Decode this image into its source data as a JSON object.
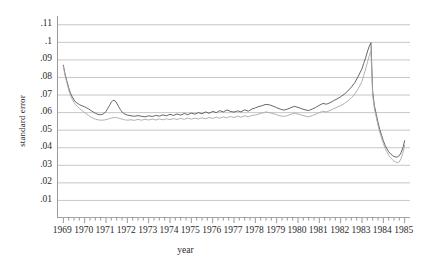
{
  "chart_data": {
    "type": "line",
    "title": "",
    "xlabel": "year",
    "ylabel": "standard error",
    "xlim": [
      1968.75,
      1985.25
    ],
    "ylim": [
      0,
      0.115
    ],
    "grid": true,
    "legend": "none",
    "y_ticks": [
      ".11",
      ".1",
      ".09",
      ".08",
      ".07",
      ".06",
      ".05",
      ".04",
      ".03",
      ".02",
      ".01"
    ],
    "y_tick_values": [
      0.11,
      0.1,
      0.09,
      0.08,
      0.07,
      0.06,
      0.05,
      0.04,
      0.03,
      0.02,
      0.01
    ],
    "x_ticks": [
      "1969",
      "1970",
      "1971",
      "1972",
      "1973",
      "1974",
      "1975",
      "1976",
      "1977",
      "1978",
      "1979",
      "1980",
      "1981",
      "1982",
      "1983",
      "1984",
      "1985"
    ],
    "x_tick_values": [
      1969,
      1970,
      1971,
      1972,
      1973,
      1974,
      1975,
      1976,
      1977,
      1978,
      1979,
      1980,
      1981,
      1982,
      1983,
      1984,
      1985
    ],
    "series": [
      {
        "name": "dark-line",
        "color": "#555555",
        "x": [
          1969.0,
          1969.08,
          1969.17,
          1969.25,
          1969.33,
          1969.42,
          1969.5,
          1969.58,
          1969.67,
          1969.75,
          1969.83,
          1969.92,
          1970.0,
          1970.08,
          1970.17,
          1970.25,
          1970.33,
          1970.42,
          1970.5,
          1970.58,
          1970.67,
          1970.75,
          1970.83,
          1970.92,
          1971.0,
          1971.08,
          1971.17,
          1971.25,
          1971.33,
          1971.42,
          1971.5,
          1971.58,
          1971.67,
          1971.75,
          1971.83,
          1971.92,
          1972.0,
          1972.17,
          1972.33,
          1972.5,
          1972.67,
          1972.83,
          1973.0,
          1973.17,
          1973.33,
          1973.5,
          1973.67,
          1973.83,
          1974.0,
          1974.17,
          1974.33,
          1974.5,
          1974.67,
          1974.83,
          1975.0,
          1975.17,
          1975.33,
          1975.5,
          1975.67,
          1975.83,
          1976.0,
          1976.17,
          1976.33,
          1976.5,
          1976.67,
          1976.83,
          1977.0,
          1977.17,
          1977.33,
          1977.5,
          1977.67,
          1977.83,
          1978.0,
          1978.17,
          1978.33,
          1978.5,
          1978.67,
          1978.83,
          1979.0,
          1979.17,
          1979.33,
          1979.5,
          1979.67,
          1979.83,
          1980.0,
          1980.17,
          1980.33,
          1980.5,
          1980.67,
          1980.83,
          1981.0,
          1981.17,
          1981.33,
          1981.5,
          1981.67,
          1981.83,
          1982.0,
          1982.17,
          1982.33,
          1982.5,
          1982.67,
          1982.83,
          1983.0,
          1983.08,
          1983.17,
          1983.25,
          1983.33,
          1983.42,
          1983.5,
          1983.58,
          1983.67,
          1983.75,
          1983.83,
          1983.92,
          1984.0,
          1984.08,
          1984.17,
          1984.25,
          1984.33,
          1984.42,
          1984.5,
          1984.58,
          1984.67,
          1984.75,
          1984.83,
          1984.92,
          1985.0
        ],
        "values": [
          0.087,
          0.082,
          0.0778,
          0.0742,
          0.0712,
          0.069,
          0.0672,
          0.066,
          0.0652,
          0.0646,
          0.0641,
          0.0637,
          0.0633,
          0.0628,
          0.0622,
          0.0616,
          0.0609,
          0.0602,
          0.0596,
          0.0592,
          0.0589,
          0.0588,
          0.059,
          0.0596,
          0.0607,
          0.0623,
          0.0642,
          0.066,
          0.067,
          0.0668,
          0.0655,
          0.0636,
          0.0618,
          0.0604,
          0.0595,
          0.059,
          0.0586,
          0.0582,
          0.0579,
          0.0583,
          0.0579,
          0.0576,
          0.0582,
          0.0578,
          0.0584,
          0.058,
          0.0587,
          0.0582,
          0.059,
          0.0584,
          0.0592,
          0.0586,
          0.0595,
          0.0588,
          0.0597,
          0.0591,
          0.06,
          0.0593,
          0.0604,
          0.0596,
          0.0607,
          0.06,
          0.0611,
          0.0604,
          0.0615,
          0.0607,
          0.0603,
          0.061,
          0.0604,
          0.0616,
          0.0608,
          0.062,
          0.0627,
          0.0635,
          0.064,
          0.0647,
          0.0644,
          0.0637,
          0.0628,
          0.062,
          0.0614,
          0.062,
          0.0628,
          0.0636,
          0.063,
          0.0622,
          0.0616,
          0.0612,
          0.062,
          0.063,
          0.0642,
          0.0652,
          0.0648,
          0.0656,
          0.0668,
          0.0678,
          0.069,
          0.0705,
          0.0722,
          0.0745,
          0.0772,
          0.0808,
          0.085,
          0.088,
          0.0912,
          0.0945,
          0.0975,
          0.0998,
          0.072,
          0.064,
          0.059,
          0.0545,
          0.0505,
          0.047,
          0.044,
          0.0415,
          0.0394,
          0.0378,
          0.0366,
          0.0357,
          0.035,
          0.0347,
          0.0348,
          0.0355,
          0.0372,
          0.04,
          0.044
        ]
      },
      {
        "name": "light-line",
        "color": "#a8a8a8",
        "x": [
          1969.0,
          1969.08,
          1969.17,
          1969.25,
          1969.33,
          1969.42,
          1969.5,
          1969.58,
          1969.67,
          1969.75,
          1969.83,
          1969.92,
          1970.0,
          1970.08,
          1970.17,
          1970.25,
          1970.33,
          1970.42,
          1970.5,
          1970.58,
          1970.67,
          1970.75,
          1970.83,
          1970.92,
          1971.0,
          1971.08,
          1971.17,
          1971.25,
          1971.33,
          1971.42,
          1971.5,
          1971.58,
          1971.67,
          1971.75,
          1971.83,
          1971.92,
          1972.0,
          1972.17,
          1972.33,
          1972.5,
          1972.67,
          1972.83,
          1973.0,
          1973.17,
          1973.33,
          1973.5,
          1973.67,
          1973.83,
          1974.0,
          1974.17,
          1974.33,
          1974.5,
          1974.67,
          1974.83,
          1975.0,
          1975.17,
          1975.33,
          1975.5,
          1975.67,
          1975.83,
          1976.0,
          1976.17,
          1976.33,
          1976.5,
          1976.67,
          1976.83,
          1977.0,
          1977.17,
          1977.33,
          1977.5,
          1977.67,
          1977.83,
          1978.0,
          1978.17,
          1978.33,
          1978.5,
          1978.67,
          1978.83,
          1979.0,
          1979.17,
          1979.33,
          1979.5,
          1979.67,
          1979.83,
          1980.0,
          1980.17,
          1980.33,
          1980.5,
          1980.67,
          1980.83,
          1981.0,
          1981.17,
          1981.33,
          1981.5,
          1981.67,
          1981.83,
          1982.0,
          1982.17,
          1982.33,
          1982.5,
          1982.67,
          1982.83,
          1983.0,
          1983.08,
          1983.17,
          1983.25,
          1983.33,
          1983.42,
          1983.5,
          1983.58,
          1983.67,
          1983.75,
          1983.83,
          1983.92,
          1984.0,
          1984.08,
          1984.17,
          1984.25,
          1984.33,
          1984.42,
          1984.5,
          1984.58,
          1984.67,
          1984.75,
          1984.83,
          1984.92,
          1985.0
        ],
        "values": [
          0.0865,
          0.0812,
          0.0768,
          0.073,
          0.07,
          0.0676,
          0.0658,
          0.0644,
          0.0633,
          0.0624,
          0.0616,
          0.0608,
          0.06,
          0.0592,
          0.0585,
          0.0578,
          0.0572,
          0.0567,
          0.0563,
          0.056,
          0.0558,
          0.0557,
          0.0557,
          0.0558,
          0.056,
          0.0563,
          0.0566,
          0.0569,
          0.0571,
          0.0572,
          0.0571,
          0.0569,
          0.0566,
          0.0563,
          0.056,
          0.0558,
          0.0557,
          0.0559,
          0.0556,
          0.0561,
          0.0557,
          0.0562,
          0.0558,
          0.0563,
          0.0558,
          0.0564,
          0.0559,
          0.0565,
          0.056,
          0.0566,
          0.0561,
          0.0567,
          0.0562,
          0.0568,
          0.0563,
          0.0569,
          0.0564,
          0.057,
          0.0565,
          0.0572,
          0.0567,
          0.0574,
          0.0568,
          0.0576,
          0.057,
          0.0578,
          0.0572,
          0.058,
          0.0574,
          0.0582,
          0.0576,
          0.0584,
          0.0586,
          0.0592,
          0.0598,
          0.0604,
          0.06,
          0.0594,
          0.0588,
          0.0582,
          0.0578,
          0.0583,
          0.059,
          0.0597,
          0.0592,
          0.0586,
          0.058,
          0.0576,
          0.0583,
          0.0591,
          0.06,
          0.0608,
          0.0604,
          0.0612,
          0.0622,
          0.0631,
          0.064,
          0.0652,
          0.0666,
          0.0684,
          0.0706,
          0.0738,
          0.0778,
          0.0812,
          0.0848,
          0.0884,
          0.092,
          0.095,
          0.07,
          0.0622,
          0.0572,
          0.0528,
          0.0489,
          0.0454,
          0.0424,
          0.0398,
          0.0376,
          0.0358,
          0.0344,
          0.0333,
          0.0324,
          0.0318,
          0.0315,
          0.032,
          0.0338,
          0.0372,
          0.0415
        ]
      }
    ]
  }
}
